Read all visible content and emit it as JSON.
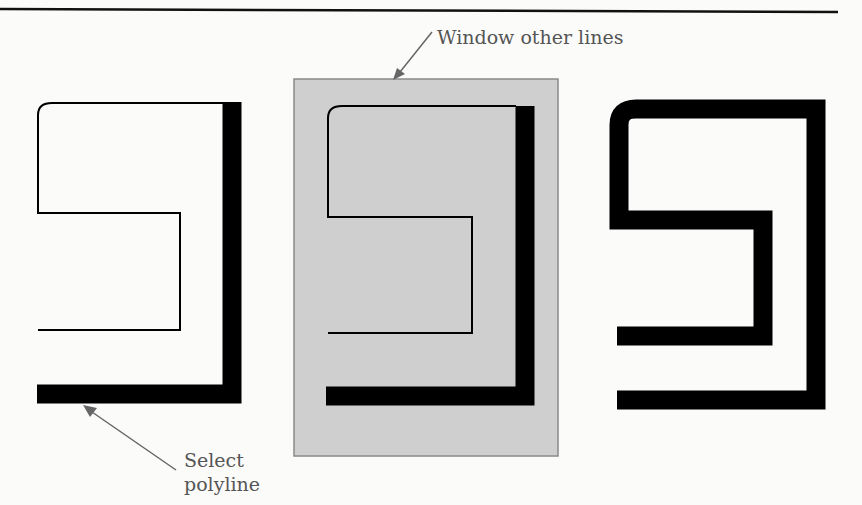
{
  "labels": {
    "window_other_lines": "Window other lines",
    "select_line1": "Select",
    "select_line2": "polyline"
  },
  "colors": {
    "background": "#fbfbfa",
    "rule": "#111111",
    "polyline": "#000000",
    "window_fill": "#cfcfcf",
    "window_border": "#8a8a8a",
    "callout": "#666666"
  },
  "panels": [
    {
      "name": "selected-polyline",
      "description": "Thin polyline with selected thick segment"
    },
    {
      "name": "windowed-polyline",
      "description": "Same polyline inside gray window region"
    },
    {
      "name": "result-polyline",
      "description": "All segments thickened"
    }
  ]
}
